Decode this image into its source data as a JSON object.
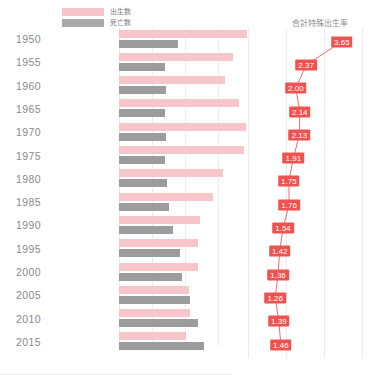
{
  "legend": {
    "items": [
      {
        "label": "出生数",
        "color": "#f7c6cb",
        "key": "births"
      },
      {
        "label": "死亡数",
        "color": "#9c9c9c",
        "key": "deaths"
      }
    ]
  },
  "bar_axis": {
    "unit": "(万人)",
    "ticks": [
      "50",
      "100",
      "150"
    ],
    "tick_values": [
      50,
      100,
      150
    ]
  },
  "line_panel": {
    "title": "合計特殊出生率"
  },
  "chart_data": {
    "type": "bar",
    "title": "",
    "xlabel": "(万人)",
    "ylabel": "",
    "xlim": [
      0,
      200
    ],
    "grid": true,
    "legend_position": "top-left",
    "categories": [
      "1950",
      "1955",
      "1960",
      "1965",
      "1970",
      "1975",
      "1980",
      "1985",
      "1990",
      "1995",
      "2000",
      "2005",
      "2010",
      "2015"
    ],
    "series": [
      {
        "name": "出生数",
        "color": "#f7c6cb",
        "values": [
          194,
          173,
          161,
          182,
          193,
          190,
          158,
          143,
          122,
          119,
          119,
          106,
          107,
          101
        ]
      },
      {
        "name": "死亡数",
        "color": "#9c9c9c",
        "values": [
          90,
          69,
          71,
          70,
          71,
          70,
          72,
          75,
          82,
          92,
          96,
          108,
          120,
          129
        ]
      }
    ],
    "secondary": {
      "type": "line",
      "name": "合計特殊出生率",
      "color": "#ef5350",
      "ylim": [
        1.0,
        3.8
      ],
      "values": [
        3.65,
        2.37,
        2.0,
        2.14,
        2.13,
        1.91,
        1.75,
        1.76,
        1.54,
        1.42,
        1.36,
        1.26,
        1.39,
        1.46
      ],
      "labels": [
        "3.65",
        "2.37",
        "2.00",
        "2.14",
        "2.13",
        "1.91",
        "1.75",
        "1.76",
        "1.54",
        "1.42",
        "1.36",
        "1.26",
        "1.39",
        "1.46"
      ]
    }
  }
}
